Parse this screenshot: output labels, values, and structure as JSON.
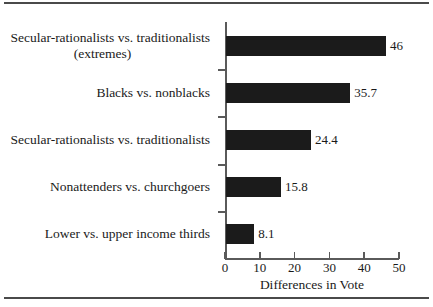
{
  "chart_data": {
    "type": "bar",
    "orientation": "horizontal",
    "title": "",
    "xlabel": "Differences in Vote",
    "ylabel": "",
    "xlim": [
      0,
      50
    ],
    "xticks": [
      0,
      10,
      20,
      30,
      40,
      50
    ],
    "xticklabels": [
      "0",
      "10",
      "20",
      "30",
      "40",
      "50"
    ],
    "grid": false,
    "legend": false,
    "bar_color": "#1b1b1b",
    "categories": [
      "Secular-rationalists vs. traditionalists (extremes)",
      "Blacks vs. nonblacks",
      "Secular-rationalists vs. traditionalists",
      "Nonattenders vs. churchgoers",
      "Lower vs. upper income thirds"
    ],
    "values": [
      46,
      35.7,
      24.4,
      15.8,
      8.1
    ],
    "value_labels": [
      "46",
      "35.7",
      "24.4",
      "15.8",
      "8.1"
    ],
    "bars": [
      {
        "label_line1": "Secular-rationalists vs. traditionalists",
        "label_line2": "(extremes)",
        "value": 46,
        "value_label": "46"
      },
      {
        "label_line1": "Blacks vs. nonblacks",
        "label_line2": "",
        "value": 35.7,
        "value_label": "35.7"
      },
      {
        "label_line1": "Secular-rationalists vs. traditionalists",
        "label_line2": "",
        "value": 24.4,
        "value_label": "24.4"
      },
      {
        "label_line1": "Nonattenders vs. churchgoers",
        "label_line2": "",
        "value": 15.8,
        "value_label": "15.8"
      },
      {
        "label_line1": "Lower vs. upper income thirds",
        "label_line2": "",
        "value": 8.1,
        "value_label": "8.1"
      }
    ]
  }
}
